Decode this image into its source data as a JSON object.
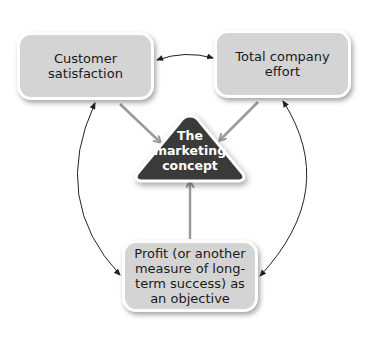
{
  "diagram": {
    "nodes": {
      "customer_satisfaction": "Customer satisfaction",
      "total_company_effort": "Total company effort",
      "marketing_concept": [
        "The",
        "marketing",
        "concept"
      ],
      "profit": "Profit (or another measure of long-term success) as an objective"
    },
    "edges": [
      {
        "from": "customer_satisfaction",
        "to": "total_company_effort",
        "type": "bidirectional-curve"
      },
      {
        "from": "customer_satisfaction",
        "to": "profit",
        "type": "bidirectional-curve"
      },
      {
        "from": "total_company_effort",
        "to": "profit",
        "type": "bidirectional-curve"
      },
      {
        "from": "customer_satisfaction",
        "to": "marketing_concept",
        "type": "arrow"
      },
      {
        "from": "total_company_effort",
        "to": "marketing_concept",
        "type": "arrow"
      },
      {
        "from": "profit",
        "to": "marketing_concept",
        "type": "arrow"
      }
    ],
    "colors": {
      "box_fill": "#d4d4d4",
      "triangle_fill": "#3a3a3a",
      "feed_arrow": "#9a9a9a",
      "curve": "#222222"
    }
  }
}
